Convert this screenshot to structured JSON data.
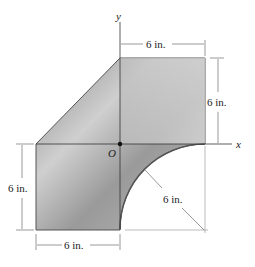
{
  "figure": {
    "axes": {
      "x_label": "x",
      "y_label": "y",
      "origin_label": "O"
    },
    "dimensions": {
      "top_width": "6 in.",
      "right_height": "6 in.",
      "left_height": "6 in.",
      "bottom_width": "6 in.",
      "arc_radius": "6 in."
    },
    "colors": {
      "shape_dark": "#6e6e6e",
      "shape_light": "#d4d4d4",
      "line": "#333333"
    }
  }
}
